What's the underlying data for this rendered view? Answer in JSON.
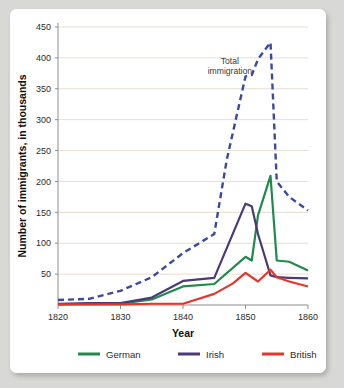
{
  "chart_data": {
    "type": "line",
    "title": "",
    "xlabel": "Year",
    "ylabel": "Number of immigrants, in thousands",
    "xlim": [
      1820,
      1860
    ],
    "ylim": [
      0,
      450
    ],
    "xticks": [
      "1820",
      "1830",
      "1840",
      "1850",
      "1860"
    ],
    "yticks": [
      "50",
      "100",
      "150",
      "200",
      "250",
      "300",
      "350",
      "400",
      "450"
    ],
    "grid": "horizontal",
    "legend_position": "bottom",
    "annotations": [
      {
        "text_line1": "Total",
        "text_line2": "immigration",
        "x": 1847.5,
        "y": 390
      }
    ],
    "series": [
      {
        "name": "Total immigration",
        "color": "#3b4a9e",
        "style": "dashed",
        "in_legend": false,
        "x": [
          1820,
          1825,
          1830,
          1835,
          1840,
          1845,
          1847,
          1850,
          1851,
          1852,
          1854,
          1855,
          1857,
          1860
        ],
        "values": [
          8,
          10,
          23,
          45,
          84,
          115,
          235,
          370,
          372,
          398,
          425,
          200,
          175,
          153
        ]
      },
      {
        "name": "German",
        "color": "#1f8a4c",
        "style": "solid",
        "in_legend": true,
        "x": [
          1820,
          1825,
          1830,
          1835,
          1840,
          1845,
          1850,
          1851,
          1852,
          1854,
          1855,
          1857,
          1860
        ],
        "values": [
          1,
          2,
          2,
          9,
          30,
          34,
          78,
          72,
          145,
          209,
          72,
          70,
          56
        ]
      },
      {
        "name": "Irish",
        "color": "#4a3a7a",
        "style": "solid",
        "in_legend": true,
        "x": [
          1820,
          1825,
          1830,
          1835,
          1840,
          1845,
          1850,
          1851,
          1852,
          1854,
          1855,
          1857,
          1860
        ],
        "values": [
          2,
          3,
          3,
          12,
          39,
          44,
          164,
          160,
          115,
          48,
          45,
          44,
          43
        ]
      },
      {
        "name": "British",
        "color": "#e8352a",
        "style": "solid",
        "in_legend": true,
        "x": [
          1820,
          1825,
          1830,
          1835,
          1840,
          1845,
          1848,
          1850,
          1852,
          1854,
          1855,
          1857,
          1860
        ],
        "values": [
          1,
          1,
          1,
          2,
          2,
          18,
          35,
          52,
          38,
          57,
          45,
          38,
          30
        ]
      }
    ]
  },
  "legend": {
    "items": [
      {
        "label": "German",
        "color": "#1f8a4c"
      },
      {
        "label": "Irish",
        "color": "#4a3a7a"
      },
      {
        "label": "British",
        "color": "#e8352a"
      }
    ]
  },
  "axes": {
    "x_title": "Year",
    "y_title": "Number of immigrants, in thousands"
  }
}
